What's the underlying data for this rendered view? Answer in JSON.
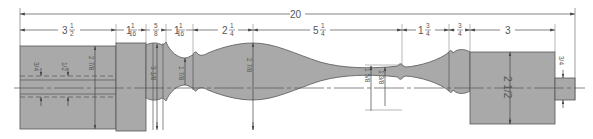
{
  "drawing": {
    "subject": "Turned spindle (table leg) profile drawing",
    "colors": {
      "body_fill": "#a9a9a9",
      "outline": "#555555",
      "dim_line": "#666666",
      "background": "#ffffff"
    },
    "overall_length": {
      "label": "20"
    },
    "length_dims": [
      {
        "id": "seg1",
        "whole": "3",
        "num": "1",
        "den": "2"
      },
      {
        "id": "seg2",
        "whole": "1",
        "num": "1",
        "den": "16"
      },
      {
        "id": "seg3",
        "whole": "",
        "num": "5",
        "den": "8"
      },
      {
        "id": "seg4",
        "whole": "1",
        "num": "1",
        "den": "16"
      },
      {
        "id": "seg5",
        "whole": "2",
        "num": "1",
        "den": "4"
      },
      {
        "id": "seg6",
        "whole": "5",
        "num": "1",
        "den": "4"
      },
      {
        "id": "seg7",
        "whole": "1",
        "num": "3",
        "den": "4"
      },
      {
        "id": "seg8",
        "whole": "",
        "num": "3",
        "den": "4"
      },
      {
        "id": "seg9",
        "whole": "3",
        "num": "",
        "den": ""
      }
    ],
    "diameter_dims": [
      {
        "id": "mortise-offset",
        "text": "3/4"
      },
      {
        "id": "mortise-width",
        "text": "1/2"
      },
      {
        "id": "square-width",
        "text": "2 7/8"
      },
      {
        "id": "bead-dia",
        "text": "3 1/8"
      },
      {
        "id": "cove-dia",
        "text": "1 7/8"
      },
      {
        "id": "vase-dia",
        "text": "2 7/8"
      },
      {
        "id": "neck-outer-dia",
        "text": "1 5/8"
      },
      {
        "id": "neck-inner-dia",
        "text": "1 3/8"
      },
      {
        "id": "foot-dia",
        "text": "2 1/2"
      },
      {
        "id": "tenon-dia",
        "text": "3/4"
      }
    ]
  }
}
